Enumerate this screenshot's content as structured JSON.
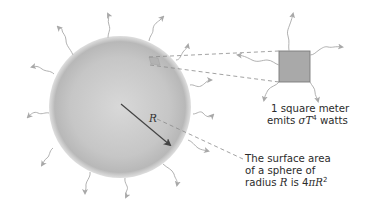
{
  "diagram": {
    "elements": {
      "sphere": {
        "label": "sphere",
        "center": [
          120,
          107
        ],
        "radius": 71,
        "fill_center": "#d6d6d6",
        "fill_edge": "#b4b4b4"
      },
      "radius_arrow": {
        "label": "R",
        "from": [
          120,
          107
        ],
        "to": [
          172,
          145
        ]
      },
      "square_patch": {
        "label": "1 square meter patch",
        "x": 279,
        "y": 51,
        "size": 31,
        "fill": "#a9a9a9",
        "stroke": "#7a7a7a"
      }
    },
    "labels": {
      "square_line1": "1 square meter",
      "square_line2_prefix": "emits ",
      "square_line2_sigma": "σT",
      "square_line2_exp": "4",
      "square_line2_suffix": " watts",
      "surface_line1": "The surface area",
      "surface_line2": "of a sphere of",
      "surface_line3_prefix": "radius ",
      "surface_line3_R": "R",
      "surface_line3_mid": " is 4",
      "surface_line3_pi": "πR",
      "surface_line3_exp": "2",
      "radius_symbol": "R"
    },
    "colors": {
      "text": "#2b2b2b",
      "arrow": "#444444",
      "wavy_arrows": "#a8a8a8",
      "dashed_lines": "#8a8a8a"
    }
  }
}
